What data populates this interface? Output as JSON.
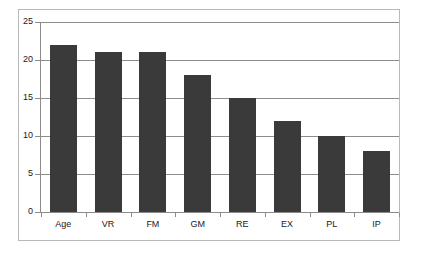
{
  "chart_data": {
    "type": "bar",
    "title": "",
    "subtitle": "",
    "xlabel": "",
    "ylabel": "",
    "categories": [
      "Age",
      "VR",
      "FM",
      "GM",
      "RE",
      "EX",
      "PL",
      "IP"
    ],
    "values": [
      22,
      21,
      21,
      18,
      15,
      12,
      10,
      8
    ],
    "series": [
      {
        "name": "",
        "values": [
          22,
          21,
          21,
          18,
          15,
          12,
          10,
          8
        ]
      }
    ],
    "ylim": [
      0,
      25
    ],
    "yticks": [
      0,
      5,
      10,
      15,
      20,
      25
    ],
    "ytick_labels": [
      "0",
      "5",
      "10",
      "15",
      "20",
      "25"
    ],
    "grid": true,
    "grid_axis": "y",
    "legend": false,
    "legend_position": "none",
    "annotations": []
  },
  "style": {
    "bar_color": "#3a3a3a",
    "grid_color": "#8c8c8c",
    "axis_color": "#8c8c8c",
    "frame_color": "#b9b9b9",
    "background": "#ffffff",
    "text_color": "#1a1a1a"
  }
}
